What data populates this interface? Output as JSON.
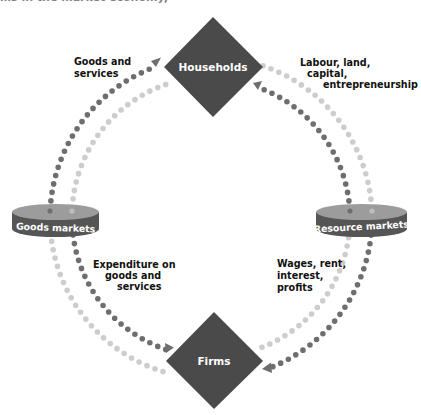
{
  "figure": {
    "clipped_caption": "…s in the market economy,",
    "colors": {
      "node_fill": "#4a4a4a",
      "flow_dark": "#6e6e6e",
      "flow_light": "#cdcdcd",
      "market_band": "#5a5a5a",
      "market_top": "#9a9a9a",
      "label_text": "#111111"
    },
    "nodes": {
      "households": {
        "label": "Households"
      },
      "firms": {
        "label": "Firms"
      }
    },
    "markets": {
      "goods": {
        "label": "Goods markets"
      },
      "resource": {
        "label": "Resource markets"
      }
    },
    "flow_labels": {
      "goods_services": {
        "line1": "Goods and",
        "line2": "services"
      },
      "factors": {
        "line1": "Labour, land,",
        "line2": "capital,",
        "line3": "entrepreneurship"
      },
      "expenditure": {
        "line1": "Expenditure on",
        "line2": "goods and",
        "line3": "services"
      },
      "incomes": {
        "line1": "Wages, rent,",
        "line2": "interest,",
        "line3": "profits"
      }
    }
  }
}
